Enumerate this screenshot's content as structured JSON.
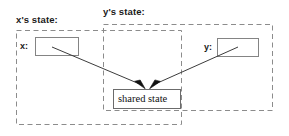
{
  "diagram": {
    "type": "state-ownership-diagram",
    "background_color": "#ffffff",
    "groups": [
      {
        "id": "x-state",
        "label": "x's state:",
        "border_style": "dashed",
        "border_color": "#808080"
      },
      {
        "id": "y-state",
        "label": "y's state:",
        "border_style": "dashed",
        "border_color": "#808080"
      }
    ],
    "variables": [
      {
        "id": "x",
        "label": "x:",
        "box_fill": "#ffffff",
        "box_border": "#808080"
      },
      {
        "id": "y",
        "label": "y:",
        "box_fill": "#ffffff",
        "box_border": "#808080"
      }
    ],
    "nodes": [
      {
        "id": "shared-state",
        "label": "shared state",
        "box_fill": "#ffffff",
        "box_border": "#666666"
      }
    ],
    "edges": [
      {
        "id": "x-to-shared",
        "from": "x",
        "to": "shared-state",
        "arrowhead": "filled",
        "color": "#333333"
      },
      {
        "id": "y-to-shared",
        "from": "y",
        "to": "shared-state",
        "arrowhead": "filled",
        "color": "#333333"
      }
    ]
  }
}
